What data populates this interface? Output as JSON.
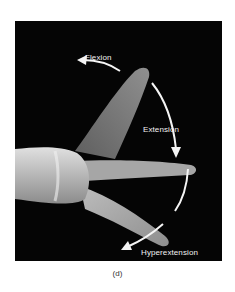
{
  "figure": {
    "labels": {
      "flexion": "Flexion",
      "extension": "Extension",
      "hyperextension": "Hyperextension"
    },
    "caption": "(d)",
    "colors": {
      "background": "#050505",
      "arrow": "#f5f5f5",
      "skin_light": "#d9d9d9",
      "skin_mid": "#9a9a9a",
      "skin_dark": "#6a6a6a"
    }
  }
}
